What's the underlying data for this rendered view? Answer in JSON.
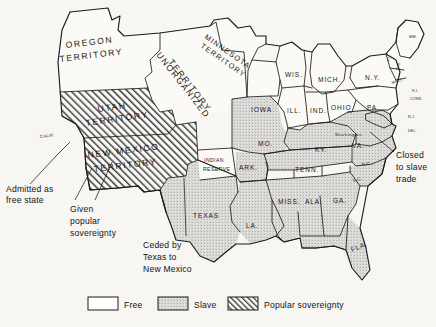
{
  "map": {
    "title": "United States 1850 — Compromise of 1850",
    "colors": {
      "background": "#f7f6f2",
      "free": "#fbfaf7",
      "slave": "#c9c9c9",
      "popular_sovereignty_hatch": "#4a4a4a",
      "ink": "#1a1a1a"
    },
    "territories": [
      {
        "id": "oregon",
        "label": "OREGON TERRITORY",
        "line1": "OREGON",
        "line2": "TERRITORY",
        "status": "free"
      },
      {
        "id": "unorganized",
        "label": "UNORGANIZED TERRITORY",
        "line1": "UNORGANIZED",
        "line2": "TERRITORY",
        "status": "free"
      },
      {
        "id": "minnesota",
        "label": "MINNESOTA TERRITORY",
        "line1": "MINNESOTA",
        "line2": "TERRITORY",
        "status": "free"
      },
      {
        "id": "utah",
        "label": "UTAH TERRITORY",
        "line1": "UTAH",
        "line2": "TERRITORY",
        "status": "popular-sovereignty"
      },
      {
        "id": "new-mexico",
        "label": "NEW MEXICO TERRITORY",
        "line1": "NEW MEXICO",
        "line2": "TERRITORY",
        "status": "popular-sovereignty"
      },
      {
        "id": "indian-reserve",
        "label": "INDIAN RESERVE",
        "line1": "INDIAN",
        "line2": "RESERVE",
        "status": "free"
      }
    ],
    "states": [
      {
        "id": "calif",
        "label": "CALIF.",
        "status": "free"
      },
      {
        "id": "iowa",
        "label": "IOWA",
        "status": "free"
      },
      {
        "id": "wis",
        "label": "WIS.",
        "status": "free"
      },
      {
        "id": "mich",
        "label": "MICH.",
        "status": "free"
      },
      {
        "id": "ill",
        "label": "ILL.",
        "status": "free"
      },
      {
        "id": "ind",
        "label": "IND.",
        "status": "free"
      },
      {
        "id": "ohio",
        "label": "OHIO",
        "status": "free"
      },
      {
        "id": "pa",
        "label": "PA.",
        "status": "free"
      },
      {
        "id": "ny",
        "label": "N.Y.",
        "status": "free"
      },
      {
        "id": "me",
        "label": "ME.",
        "status": "free"
      },
      {
        "id": "vt",
        "label": "VT.",
        "status": "free"
      },
      {
        "id": "nh",
        "label": "N.H.",
        "status": "free"
      },
      {
        "id": "mass",
        "label": "MASS.",
        "status": "free"
      },
      {
        "id": "ri",
        "label": "R.I.",
        "status": "free"
      },
      {
        "id": "conn",
        "label": "CONN.",
        "status": "free"
      },
      {
        "id": "nj",
        "label": "N.J.",
        "status": "free"
      },
      {
        "id": "del",
        "label": "DEL.",
        "status": "slave"
      },
      {
        "id": "mo",
        "label": "MO.",
        "status": "slave"
      },
      {
        "id": "ark",
        "label": "ARK.",
        "status": "slave"
      },
      {
        "id": "texas",
        "label": "TEXAS",
        "status": "slave"
      },
      {
        "id": "la",
        "label": "LA.",
        "status": "slave"
      },
      {
        "id": "miss",
        "label": "MISS.",
        "status": "slave"
      },
      {
        "id": "ala",
        "label": "ALA.",
        "status": "slave"
      },
      {
        "id": "ga",
        "label": "GA.",
        "status": "slave"
      },
      {
        "id": "fla",
        "label": "FLA.",
        "status": "slave"
      },
      {
        "id": "tenn",
        "label": "TENN.",
        "status": "slave"
      },
      {
        "id": "ky",
        "label": "KY.",
        "status": "slave"
      },
      {
        "id": "va",
        "label": "VA.",
        "status": "slave"
      },
      {
        "id": "nc",
        "label": "N.C.",
        "status": "slave"
      },
      {
        "id": "sc",
        "label": "S.C.",
        "status": "slave"
      },
      {
        "id": "washington",
        "label": "Washington",
        "status": "slave"
      }
    ],
    "annotations": [
      {
        "id": "admitted-free",
        "line1": "Admitted as",
        "line2": "free state",
        "line3": "",
        "target": "calif"
      },
      {
        "id": "popular-sovereignty-note",
        "line1": "Given",
        "line2": "popular",
        "line3": "sovereignty",
        "target": "utah-new-mexico"
      },
      {
        "id": "ceded-by-texas",
        "line1": "Ceded by",
        "line2": "Texas to",
        "line3": "New Mexico",
        "target": "new-mexico"
      },
      {
        "id": "closed-slave-trade",
        "line1": "Closed",
        "line2": "to slave",
        "line3": "trade",
        "target": "washington"
      }
    ],
    "legend": {
      "items": [
        {
          "id": "free",
          "label": "Free",
          "swatch": "white"
        },
        {
          "id": "slave",
          "label": "Slave",
          "swatch": "stipple"
        },
        {
          "id": "popular-sovereignty",
          "label": "Popular sovereignty",
          "swatch": "hatch"
        }
      ]
    }
  }
}
